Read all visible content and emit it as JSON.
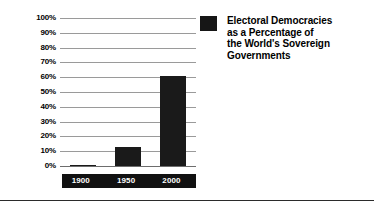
{
  "chart_data": {
    "type": "bar",
    "title": "",
    "categories": [
      "1900",
      "1950",
      "2000"
    ],
    "values": [
      1,
      13,
      61
    ],
    "xlabel": "",
    "ylabel": "",
    "ylim": [
      0,
      100
    ],
    "ytick_labels": [
      "100%",
      "90%",
      "80%",
      "70%",
      "60%",
      "50%",
      "40%",
      "30%",
      "20%",
      "10%",
      "0%"
    ],
    "ytick_values": [
      100,
      90,
      80,
      70,
      60,
      50,
      40,
      30,
      20,
      10,
      0
    ],
    "grid": true,
    "legend_position": "right",
    "series": [
      {
        "name": "Electoral Democracies as a Percentage of the World's Sovereign Governments",
        "values": [
          1,
          13,
          61
        ],
        "color": "#1a1a1a"
      }
    ],
    "colors": {
      "bar": "#1a1a1a",
      "gridline": "#9a9a9a",
      "axis_band": "#111111",
      "axis_band_text": "#ffffff",
      "text": "#000000",
      "background": "#ffffff"
    }
  },
  "legend": {
    "swatch_color": "#161616",
    "lines": [
      "Electoral Democracies",
      "as a Percentage of",
      "the World's Sovereign",
      "Governments"
    ]
  }
}
